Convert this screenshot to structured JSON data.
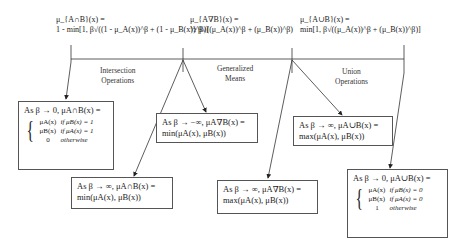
{
  "top_formulas": {
    "intersection": {
      "lhs": "μ_{A∩B}(x) =",
      "rhs": "1 - min[1, β√((1 - μ_A(x))^β + (1 - μ_B(x))^β)]"
    },
    "generalized_mean": {
      "lhs": "μ_{A∇B}(x) =",
      "rhs": "½ β√((μ_A(x))^β + (μ_B(x))^β)"
    },
    "union": {
      "lhs": "μ_{A∪B}(x) =",
      "rhs": "min[1, β√((μ_A(x))^β + (μ_B(x))^β)]"
    }
  },
  "labels": {
    "intersection": [
      "Intersection",
      "Operations"
    ],
    "generalized_means": [
      "Generalized",
      "Means"
    ],
    "union": [
      "Union",
      "Operations"
    ]
  },
  "boxes": {
    "intersection_beta_0": {
      "header": "As β → 0, μA∩B(x) =",
      "cases": [
        {
          "value": "μA(x)",
          "condition": "if μB(x) = 1"
        },
        {
          "value": "μB(x)",
          "condition": "if μA(x) = 1"
        },
        {
          "value": "0",
          "condition": "otherwise"
        }
      ]
    },
    "intersection_beta_inf": {
      "line1": "As β → ∞, μA∩B(x) =",
      "line2": "min(μA(x), μB(x))"
    },
    "mean_beta_neg_inf": {
      "line1": "As β → −∞, μA∇B(x) =",
      "line2": "min(μA(x), μB(x))"
    },
    "mean_beta_inf": {
      "line1": "As β → ∞, μA∇B(x) =",
      "line2": "max(μA(x), μB(x))"
    },
    "union_beta_inf": {
      "line1": "As β → ∞, μA∪B(x) =",
      "line2": "max(μA(x), μB(x))"
    },
    "union_beta_0": {
      "header": "As β → 0, μA∪B(x) =",
      "cases": [
        {
          "value": "μA(x)",
          "condition": "if μB(x) = 0"
        },
        {
          "value": "μB(x)",
          "condition": "if μA(x) = 0"
        },
        {
          "value": "1",
          "condition": "otherwise"
        }
      ]
    }
  },
  "colors": {
    "line": "#333333",
    "box_border": "#555555",
    "text": "#222222"
  }
}
